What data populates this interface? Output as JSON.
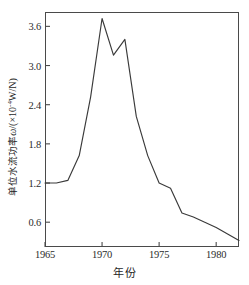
{
  "chart_data": {
    "type": "line",
    "title": "",
    "xlabel": "年份",
    "ylabel_cn": "单位水流功率",
    "ylabel_symbol": "ω",
    "ylabel_units": "/(×10⁻⁴W/N)",
    "ylabel_full": "单位水流功率ω/(×10⁻⁴W/N)",
    "xlim": [
      1965,
      1982
    ],
    "ylim": [
      0.22,
      3.82
    ],
    "xticks": [
      1965,
      1970,
      1975,
      1980
    ],
    "xtick_labels": [
      "1965",
      "1970",
      "1975",
      "1980"
    ],
    "yticks": [
      0.6,
      1.2,
      1.8,
      2.4,
      3.0,
      3.6
    ],
    "ytick_labels": [
      "0.6",
      "1.2",
      "1.8",
      "2.4",
      "3.0",
      "3.6"
    ],
    "grid": false,
    "legend": null,
    "series": [
      {
        "name": "单位水流功率",
        "color": "#3a3a3a",
        "x": [
          1965,
          1966,
          1967,
          1968,
          1969,
          1970,
          1971,
          1972,
          1973,
          1974,
          1975,
          1976,
          1977,
          1978,
          1979,
          1980,
          1981,
          1982
        ],
        "y": [
          1.2,
          1.2,
          1.24,
          1.62,
          2.52,
          3.72,
          3.16,
          3.4,
          2.22,
          1.62,
          1.2,
          1.12,
          0.74,
          0.68,
          0.6,
          0.52,
          0.42,
          0.32
        ]
      }
    ]
  },
  "axes": {
    "x_tick_labels": [
      "1965",
      "1970",
      "1975",
      "1980"
    ],
    "y_tick_labels": [
      "0.6",
      "1.2",
      "1.8",
      "2.4",
      "3.0",
      "3.6"
    ],
    "x_title": "年份",
    "y_title_cn": "单位水流功率",
    "y_title_var": "ω",
    "y_title_unit_open": "/(×10",
    "y_title_exp": "-4",
    "y_title_unit_close": "W/N)"
  }
}
